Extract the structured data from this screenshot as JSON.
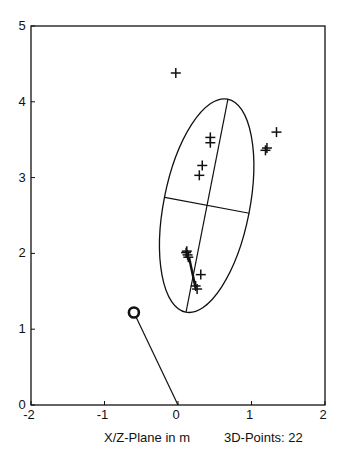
{
  "chart_data": {
    "type": "scatter",
    "title": "",
    "xlabel": "X/Z-Plane in m",
    "ylabel": "",
    "annotation": "3D-Points: 22",
    "xlim": [
      -2,
      2
    ],
    "ylim": [
      0,
      5
    ],
    "xticks": [
      "-2",
      "-1",
      "0",
      "1",
      "2"
    ],
    "xtick_values": [
      -2,
      -1,
      0,
      1,
      2
    ],
    "yticks": [
      "0",
      "1",
      "2",
      "3",
      "4",
      "5"
    ],
    "ytick_values": [
      0,
      1,
      2,
      3,
      4,
      5
    ],
    "grid": false,
    "points": [
      {
        "x": -0.03,
        "y": 4.38
      },
      {
        "x": 0.44,
        "y": 3.53
      },
      {
        "x": 0.44,
        "y": 3.46
      },
      {
        "x": 0.33,
        "y": 3.16
      },
      {
        "x": 0.29,
        "y": 3.03
      },
      {
        "x": 1.34,
        "y": 3.6
      },
      {
        "x": 1.21,
        "y": 3.39
      },
      {
        "x": 1.19,
        "y": 3.36
      },
      {
        "x": 0.12,
        "y": 2.03
      },
      {
        "x": 0.11,
        "y": 2.01
      },
      {
        "x": 0.13,
        "y": 1.98
      },
      {
        "x": 0.14,
        "y": 1.95
      },
      {
        "x": 0.31,
        "y": 1.72
      },
      {
        "x": 0.24,
        "y": 1.57
      },
      {
        "x": 0.26,
        "y": 1.53
      }
    ],
    "ellipse": {
      "center": {
        "x": 0.39,
        "y": 2.63
      },
      "major_axis_ends": [
        {
          "x": 0.68,
          "y": 4.04
        },
        {
          "x": 0.11,
          "y": 1.23
        }
      ],
      "minor_axis_ends": [
        {
          "x": -0.18,
          "y": 2.74
        },
        {
          "x": 0.97,
          "y": 2.53
        }
      ]
    },
    "trajectory": [
      {
        "x": 0.15,
        "y": 1.95
      },
      {
        "x": 0.24,
        "y": 1.54
      }
    ],
    "camera": {
      "position": {
        "x": -0.6,
        "y": 1.22
      },
      "direction_end": {
        "x": 0.0,
        "y": 0.0
      }
    }
  }
}
